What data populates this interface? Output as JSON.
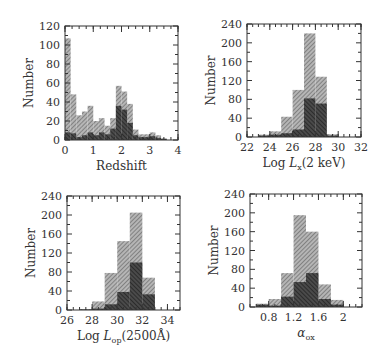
{
  "chart_data": [
    {
      "type": "bar",
      "title": "",
      "xlabel": "Redshift",
      "ylabel": "Number",
      "xlim": [
        0,
        4
      ],
      "ylim": [
        0,
        120
      ],
      "xticks": [
        0,
        1,
        2,
        3,
        4
      ],
      "yticks": [
        0,
        20,
        40,
        60,
        80,
        100,
        120
      ],
      "bin_width": 0.2,
      "bin_start": [
        0,
        0.2,
        0.4,
        0.6,
        0.8,
        1.0,
        1.2,
        1.4,
        1.6,
        1.8,
        2.0,
        2.2,
        2.4,
        2.6,
        2.8,
        3.0,
        3.2,
        3.4,
        3.6,
        3.8
      ],
      "series": [
        {
          "name": "all",
          "shade": "light-hatched",
          "values": [
            107,
            48,
            26,
            30,
            36,
            20,
            23,
            15,
            23,
            57,
            51,
            38,
            11,
            6,
            6,
            8,
            5,
            2,
            0,
            0
          ]
        },
        {
          "name": "subset",
          "shade": "dark-hatched",
          "values": [
            8,
            7,
            3,
            5,
            8,
            5,
            8,
            6,
            12,
            36,
            32,
            18,
            5,
            3,
            3,
            4,
            2,
            1,
            0,
            0
          ]
        }
      ],
      "frame": {
        "x0": 65,
        "x1": 178,
        "y0": 26,
        "y1": 140
      }
    },
    {
      "type": "bar",
      "title": "",
      "xlabel": "Log L_x(2 keV)",
      "xlabel_main": "Log ",
      "xlabel_sym": "L",
      "xlabel_sub": "x",
      "xlabel_tail": "(2 keV)",
      "ylabel": "Number",
      "xlim": [
        22,
        32
      ],
      "ylim": [
        0,
        240
      ],
      "xticks": [
        22,
        24,
        26,
        28,
        30,
        32
      ],
      "yticks": [
        0,
        40,
        80,
        120,
        160,
        200,
        240
      ],
      "bin_width": 1,
      "bin_start": [
        23,
        24,
        25,
        26,
        27,
        28,
        29
      ],
      "series": [
        {
          "name": "all",
          "shade": "light-hatched",
          "values": [
            5,
            12,
            43,
            100,
            220,
            128,
            6
          ]
        },
        {
          "name": "subset",
          "shade": "dark-hatched",
          "values": [
            3,
            5,
            8,
            16,
            82,
            71,
            3
          ]
        }
      ],
      "frame": {
        "x0": 247,
        "x1": 361,
        "y0": 24,
        "y1": 137
      }
    },
    {
      "type": "bar",
      "title": "",
      "xlabel": "Log L_op(2500Å)",
      "xlabel_main": "Log ",
      "xlabel_sym": "L",
      "xlabel_sub": "op",
      "xlabel_tail": "(2500Å)",
      "ylabel": "Number",
      "xlim": [
        26,
        35
      ],
      "ylim": [
        0,
        240
      ],
      "xticks": [
        26,
        28,
        30,
        32,
        34
      ],
      "yticks": [
        0,
        40,
        80,
        120,
        160,
        200,
        240
      ],
      "bin_width": 1,
      "bin_start": [
        27,
        28,
        29,
        30,
        31,
        32
      ],
      "series": [
        {
          "name": "all",
          "shade": "light-hatched",
          "values": [
            2,
            18,
            78,
            145,
            205,
            68
          ]
        },
        {
          "name": "subset",
          "shade": "dark-hatched",
          "values": [
            1,
            3,
            12,
            38,
            100,
            33
          ]
        }
      ],
      "frame": {
        "x0": 67,
        "x1": 180,
        "y0": 196,
        "y1": 310
      }
    },
    {
      "type": "bar",
      "title": "",
      "xlabel": "α_ox",
      "xlabel_main": "",
      "xlabel_sym": "α",
      "xlabel_sub": "ox",
      "xlabel_tail": "",
      "ylabel": "Number",
      "xlim": [
        0.5,
        2.3
      ],
      "ylim": [
        0,
        240
      ],
      "xticks": [
        0.8,
        1.2,
        1.6,
        2
      ],
      "yticks": [
        0,
        40,
        80,
        120,
        160,
        200,
        240
      ],
      "bin_width": 0.2,
      "bin_start": [
        0.6,
        0.8,
        1.0,
        1.2,
        1.4,
        1.6,
        1.8
      ],
      "series": [
        {
          "name": "all",
          "shade": "light-hatched",
          "values": [
            7,
            17,
            72,
            195,
            160,
            48,
            15
          ]
        },
        {
          "name": "subset",
          "shade": "dark-hatched",
          "values": [
            5,
            3,
            22,
            53,
            72,
            17,
            5
          ]
        }
      ],
      "frame": {
        "x0": 250,
        "x1": 362,
        "y0": 194,
        "y1": 307
      }
    }
  ],
  "colors": {
    "light": "#8a8a8a",
    "dark": "#2e2e2e",
    "axis": "#333333"
  }
}
